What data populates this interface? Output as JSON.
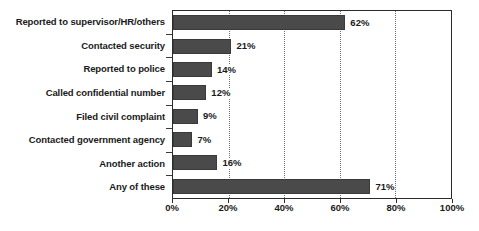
{
  "chart_data": {
    "type": "bar",
    "orientation": "horizontal",
    "title": "",
    "xlabel": "",
    "ylabel": "",
    "xlim": [
      0,
      100
    ],
    "grid": true,
    "legend": false,
    "value_suffix": "%",
    "categories": [
      "Reported to supervisor/HR/others",
      "Contacted security",
      "Reported to police",
      "Called confidential number",
      "Filed civil complaint",
      "Contacted government agency",
      "Another action",
      "Any of these"
    ],
    "values": [
      62,
      21,
      14,
      12,
      9,
      7,
      16,
      71
    ],
    "value_labels": [
      "62%",
      "21%",
      "14%",
      "12%",
      "9%",
      "7%",
      "16%",
      "71%"
    ],
    "xticks": [
      0,
      20,
      40,
      60,
      80,
      100
    ],
    "xtick_labels": [
      "0%",
      "20%",
      "40%",
      "60%",
      "80%",
      "100%"
    ],
    "colors": {
      "bar_fill": "#4a4a4a",
      "bar_edge": "#3a3a3a",
      "gridline": "#6e6e6e",
      "axis": "#2b2b2b",
      "text": "#1a1a1a",
      "background": "#ffffff"
    }
  }
}
